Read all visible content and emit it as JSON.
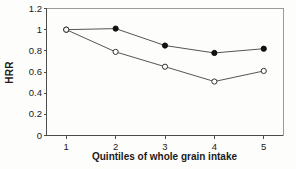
{
  "figure": {
    "background_color": "#fdfdfc",
    "axis_color": "#4d4d4d",
    "frame_color": "#9a9a9a",
    "line_color": "#555555",
    "filled_marker_color": "#111111",
    "open_marker_fill": "#ffffff"
  },
  "chart_data": {
    "type": "line",
    "title": "",
    "subtitle": "",
    "xlabel": "Quintiles of whole grain intake",
    "ylabel": "HRR",
    "categories": [
      "1",
      "2",
      "3",
      "4",
      "5"
    ],
    "x": [
      1,
      2,
      3,
      4,
      5
    ],
    "xlim": [
      0.6,
      5.4
    ],
    "ylim": [
      0,
      1.2
    ],
    "yticks": [
      0,
      0.2,
      0.4,
      0.6,
      0.8,
      1,
      1.2
    ],
    "ytick_labels": [
      "0",
      "0.2",
      "0.4",
      "0.6",
      "0.8",
      "1",
      "1.2"
    ],
    "xticks": [
      1,
      2,
      3,
      4,
      5
    ],
    "xtick_labels": [
      "1",
      "2",
      "3",
      "4",
      "5"
    ],
    "grid": false,
    "legend": false,
    "legend_position": "none",
    "series": [
      {
        "name": "Closed circles (age-adjusted)",
        "marker": "filled-circle",
        "values": [
          1.0,
          1.01,
          0.85,
          0.78,
          0.82
        ]
      },
      {
        "name": "Open circles (multivariate-adjusted)",
        "marker": "open-circle",
        "values": [
          1.0,
          0.79,
          0.65,
          0.51,
          0.61
        ]
      }
    ]
  }
}
